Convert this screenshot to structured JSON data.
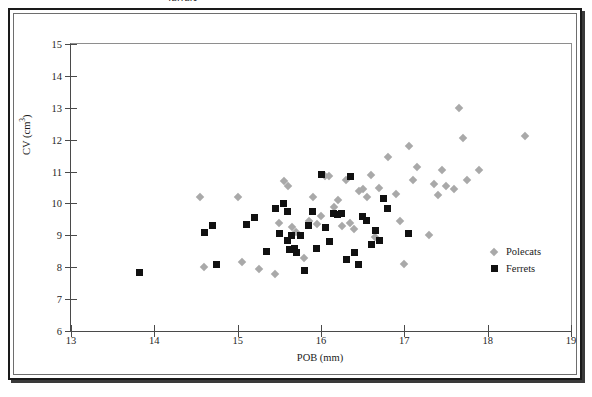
{
  "document": {
    "top_caption": "ferrets."
  },
  "legend": {
    "position": "inside-bottom-right",
    "entries": [
      {
        "label": "Polecats",
        "marker": "diamond-icon",
        "color": "#a9a9a9"
      },
      {
        "label": "Ferrets",
        "marker": "square-icon",
        "color": "#111111"
      }
    ]
  },
  "chart_data": {
    "type": "scatter",
    "title": "",
    "xlabel": "POB (mm)",
    "ylabel": "CV (cm³)",
    "xlim": [
      13,
      19
    ],
    "ylim": [
      6,
      15
    ],
    "xticks": [
      13,
      14,
      15,
      16,
      17,
      18,
      19
    ],
    "yticks": [
      6,
      7,
      8,
      9,
      10,
      11,
      12,
      13,
      14,
      15
    ],
    "grid": false,
    "legend_entries": [
      "Polecats",
      "Ferrets"
    ],
    "series": [
      {
        "name": "Polecats",
        "marker": "diamond",
        "color": "#a9a9a9",
        "points": [
          [
            14.55,
            10.2
          ],
          [
            14.6,
            8.0
          ],
          [
            15.0,
            10.2
          ],
          [
            15.05,
            8.15
          ],
          [
            15.25,
            7.95
          ],
          [
            15.45,
            7.8
          ],
          [
            15.5,
            9.4
          ],
          [
            15.55,
            10.7
          ],
          [
            15.6,
            10.55
          ],
          [
            15.65,
            9.25
          ],
          [
            15.7,
            9.1
          ],
          [
            15.8,
            8.3
          ],
          [
            15.85,
            9.45
          ],
          [
            15.9,
            10.2
          ],
          [
            15.95,
            9.35
          ],
          [
            16.0,
            9.6
          ],
          [
            16.05,
            10.85
          ],
          [
            16.1,
            10.85
          ],
          [
            16.15,
            9.9
          ],
          [
            16.2,
            10.1
          ],
          [
            16.25,
            9.3
          ],
          [
            16.3,
            10.75
          ],
          [
            16.35,
            9.4
          ],
          [
            16.4,
            9.2
          ],
          [
            16.45,
            10.4
          ],
          [
            16.5,
            10.45
          ],
          [
            16.55,
            10.2
          ],
          [
            16.6,
            10.9
          ],
          [
            16.65,
            8.95
          ],
          [
            16.7,
            10.5
          ],
          [
            16.8,
            11.45
          ],
          [
            16.9,
            10.3
          ],
          [
            16.95,
            9.45
          ],
          [
            17.0,
            8.1
          ],
          [
            17.05,
            11.8
          ],
          [
            17.1,
            10.75
          ],
          [
            17.15,
            11.15
          ],
          [
            17.3,
            9.0
          ],
          [
            17.35,
            10.6
          ],
          [
            17.4,
            10.25
          ],
          [
            17.45,
            11.05
          ],
          [
            17.5,
            10.55
          ],
          [
            17.6,
            10.45
          ],
          [
            17.65,
            13.0
          ],
          [
            17.7,
            12.05
          ],
          [
            17.75,
            10.75
          ],
          [
            17.9,
            11.05
          ],
          [
            18.45,
            12.1
          ]
        ]
      },
      {
        "name": "Ferrets",
        "marker": "square",
        "color": "#111111",
        "points": [
          [
            13.82,
            7.82
          ],
          [
            14.6,
            9.1
          ],
          [
            14.7,
            9.3
          ],
          [
            14.75,
            8.1
          ],
          [
            15.1,
            9.35
          ],
          [
            15.2,
            9.55
          ],
          [
            15.35,
            8.5
          ],
          [
            15.45,
            9.85
          ],
          [
            15.5,
            9.05
          ],
          [
            15.55,
            10.0
          ],
          [
            15.6,
            9.75
          ],
          [
            15.6,
            8.85
          ],
          [
            15.62,
            8.55
          ],
          [
            15.65,
            9.0
          ],
          [
            15.68,
            8.6
          ],
          [
            15.7,
            8.45
          ],
          [
            15.75,
            9.0
          ],
          [
            15.8,
            7.9
          ],
          [
            15.85,
            9.3
          ],
          [
            15.9,
            9.75
          ],
          [
            15.95,
            8.6
          ],
          [
            16.0,
            10.9
          ],
          [
            16.05,
            9.25
          ],
          [
            16.1,
            8.8
          ],
          [
            16.15,
            9.7
          ],
          [
            16.2,
            9.65
          ],
          [
            16.25,
            9.7
          ],
          [
            16.3,
            8.25
          ],
          [
            16.35,
            10.85
          ],
          [
            16.4,
            8.45
          ],
          [
            16.45,
            8.1
          ],
          [
            16.5,
            9.6
          ],
          [
            16.55,
            9.45
          ],
          [
            16.6,
            8.7
          ],
          [
            16.65,
            9.15
          ],
          [
            16.7,
            8.85
          ],
          [
            16.75,
            10.15
          ],
          [
            16.8,
            9.85
          ],
          [
            17.05,
            9.05
          ]
        ]
      }
    ]
  }
}
